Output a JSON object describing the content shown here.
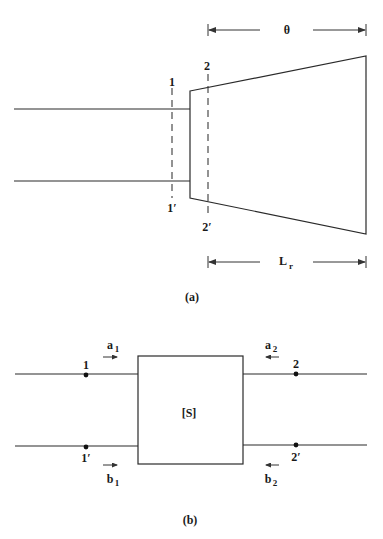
{
  "figure_a": {
    "caption": "(a)",
    "dimension_top": {
      "label": "θ"
    },
    "dimension_bottom": {
      "label": "L",
      "label_sub": "r"
    },
    "plane_1": {
      "top_label": "1",
      "bottom_label": "1′"
    },
    "plane_2": {
      "top_label": "2",
      "bottom_label": "2′"
    }
  },
  "figure_b": {
    "caption": "(b)",
    "block_label": "[S]",
    "port1": {
      "top_label": "1",
      "bottom_label": "1′"
    },
    "port2": {
      "top_label": "2",
      "bottom_label": "2′"
    },
    "waves": {
      "a1": {
        "label": "a",
        "sub": "1"
      },
      "b1": {
        "label": "b",
        "sub": "1"
      },
      "a2": {
        "label": "a",
        "sub": "2"
      },
      "b2": {
        "label": "b",
        "sub": "2"
      }
    }
  }
}
